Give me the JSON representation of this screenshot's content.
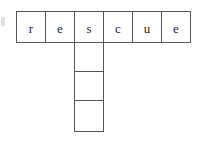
{
  "puzzle": {
    "type": "crossword-fragment",
    "background_color": "#ffffff",
    "border_color": "#565656",
    "text_color": "#1c1c1c",
    "across_entry": {
      "word": "rescue",
      "cells": [
        {
          "letter": "r",
          "filled": true
        },
        {
          "letter": "e",
          "filled": true
        },
        {
          "letter": "s",
          "filled": true
        },
        {
          "letter": "c",
          "filled": true
        },
        {
          "letter": "u",
          "filled": true
        },
        {
          "letter": "e",
          "filled": true
        }
      ],
      "origin": {
        "x": 16,
        "y": 11
      },
      "cell_width": 29,
      "cell_height": 31
    },
    "down_entry": {
      "word": "",
      "intersects_across_index": 2,
      "cells": [
        {
          "letter": "",
          "filled": false
        },
        {
          "letter": "",
          "filled": false
        },
        {
          "letter": "",
          "filled": false
        }
      ],
      "origin": {
        "x": 74,
        "y": 42
      },
      "cell_width": 29,
      "cell_height": 30
    }
  }
}
